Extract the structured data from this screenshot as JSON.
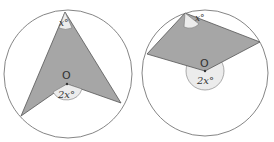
{
  "figures": [
    {
      "name": "figure-left",
      "center_label": "O",
      "inscribed_angle_label": "x°",
      "central_angle_label": "2x°"
    },
    {
      "name": "figure-right",
      "center_label": "O",
      "inscribed_angle_label": "x°",
      "central_angle_label": "2x°"
    }
  ],
  "colors": {
    "shade": "#a6a6a6",
    "angle_fill": "#ececec",
    "stroke": "#555555"
  }
}
